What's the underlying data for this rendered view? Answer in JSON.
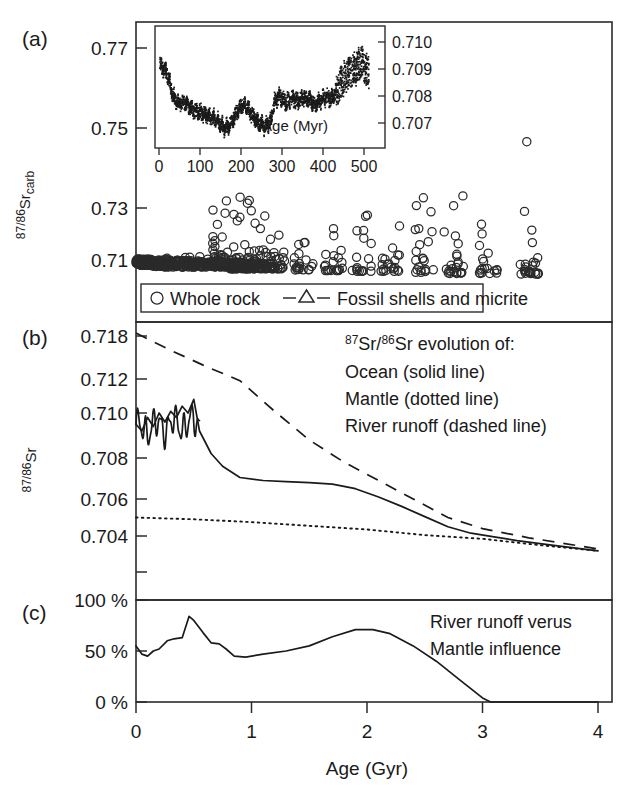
{
  "figure": {
    "panels": [
      {
        "letter": "(a)"
      },
      {
        "letter": "(b)"
      },
      {
        "letter": "(c)"
      }
    ],
    "xaxis": {
      "title": "Age (Gyr)",
      "ticks": [
        "0",
        "1",
        "2",
        "3",
        "4"
      ],
      "range": [
        0,
        4
      ]
    }
  },
  "panel_a": {
    "letter": "(a)",
    "ylabel_main": "87/86",
    "ylabel_element": "Sr",
    "ylabel_sub": "carb",
    "yticks": [
      "0.77",
      "0.75",
      "0.73",
      "0.71"
    ],
    "legend": [
      {
        "symbol": "circle",
        "label": "Whole rock"
      },
      {
        "symbol": "triangle-line",
        "label": "Fossil shells and micrite"
      }
    ],
    "inset": {
      "xlabel": "Age (Myr)",
      "xticks": [
        "0",
        "100",
        "200",
        "300",
        "400",
        "500"
      ],
      "yticks": [
        "0.710",
        "0.709",
        "0.708",
        "0.707"
      ],
      "xrange": [
        0,
        550
      ],
      "yrange": [
        0.7065,
        0.7105
      ]
    }
  },
  "panel_b": {
    "letter": "(b)",
    "ylabel_main": "87/86",
    "ylabel_element": "Sr",
    "yticks": [
      "0.718",
      "0.712",
      "0.710",
      "0.708",
      "0.706",
      "0.704"
    ],
    "annotation": [
      "87Sr/86Sr evolution of:",
      "Ocean (solid line)",
      "Mantle (dotted line)",
      "River runoff (dashed line)"
    ],
    "annotation_line1_parts": {
      "sup1": "87",
      "mid": "Sr/",
      "sup2": "86",
      "tail": "Sr evolution of:"
    }
  },
  "panel_c": {
    "letter": "(c)",
    "yticks": [
      "100 %",
      "50 %",
      "0 %"
    ],
    "annotation": [
      "River runoff verus",
      "Mantle influence"
    ]
  },
  "chart_data": {
    "type": "line",
    "xlabel": "Age (Gyr)",
    "xlim": [
      0,
      4
    ],
    "panels": [
      {
        "id": "a",
        "type": "scatter",
        "ylabel": "87/86Sr_carb",
        "ylim": [
          0.7,
          0.781
        ],
        "yticks": [
          0.77,
          0.75,
          0.73,
          0.71
        ],
        "legend": [
          "Whole rock",
          "Fossil shells and micrite"
        ],
        "description": "Measured 87/86Sr of carbonates (whole rock, fossil shells and micrite) versus age; scatter increases with age due to diagenetic alteration.",
        "clusters": [
          {
            "age": 0.02,
            "n": 26,
            "sr_min": 0.7085,
            "sr_max": 0.7105
          },
          {
            "age": 0.1,
            "n": 22,
            "sr_min": 0.7085,
            "sr_max": 0.7105
          },
          {
            "age": 0.2,
            "n": 20,
            "sr_min": 0.7082,
            "sr_max": 0.7105
          },
          {
            "age": 0.3,
            "n": 18,
            "sr_min": 0.708,
            "sr_max": 0.7108
          },
          {
            "age": 0.45,
            "n": 24,
            "sr_min": 0.708,
            "sr_max": 0.711
          },
          {
            "age": 0.6,
            "n": 26,
            "sr_min": 0.708,
            "sr_max": 0.716
          },
          {
            "age": 0.75,
            "n": 40,
            "sr_min": 0.708,
            "sr_max": 0.727
          },
          {
            "age": 0.9,
            "n": 46,
            "sr_min": 0.7075,
            "sr_max": 0.731
          },
          {
            "age": 1.05,
            "n": 40,
            "sr_min": 0.7075,
            "sr_max": 0.73
          },
          {
            "age": 1.2,
            "n": 30,
            "sr_min": 0.7075,
            "sr_max": 0.722
          },
          {
            "age": 1.45,
            "n": 20,
            "sr_min": 0.7072,
            "sr_max": 0.716
          },
          {
            "age": 1.7,
            "n": 22,
            "sr_min": 0.707,
            "sr_max": 0.719
          },
          {
            "age": 1.95,
            "n": 18,
            "sr_min": 0.7068,
            "sr_max": 0.724
          },
          {
            "age": 2.2,
            "n": 20,
            "sr_min": 0.7068,
            "sr_max": 0.723
          },
          {
            "age": 2.5,
            "n": 22,
            "sr_min": 0.7065,
            "sr_max": 0.729
          },
          {
            "age": 2.75,
            "n": 24,
            "sr_min": 0.7062,
            "sr_max": 0.73
          },
          {
            "age": 3.05,
            "n": 18,
            "sr_min": 0.7062,
            "sr_max": 0.725
          },
          {
            "age": 3.4,
            "n": 26,
            "sr_min": 0.706,
            "sr_max": 0.756
          }
        ],
        "inset": {
          "type": "scatter",
          "xlabel": "Age (Myr)",
          "xlim": [
            0,
            550
          ],
          "xticks": [
            0,
            100,
            200,
            300,
            400,
            500
          ],
          "ylim": [
            0.7065,
            0.7105
          ],
          "yticks": [
            0.707,
            0.708,
            0.709,
            0.71
          ],
          "description": "Phanerozoic seawater 87Sr/86Sr curve: high at 0 Myr (~0.7092), minimum near 170 Myr (~0.7068), oscillating rise toward 500-540 Myr (~0.7092-0.7100).",
          "curve_points": [
            {
              "x": 0,
              "y": 0.70918
            },
            {
              "x": 10,
              "y": 0.70905
            },
            {
              "x": 20,
              "y": 0.7088
            },
            {
              "x": 35,
              "y": 0.708
            },
            {
              "x": 50,
              "y": 0.70775
            },
            {
              "x": 65,
              "y": 0.70778
            },
            {
              "x": 80,
              "y": 0.7076
            },
            {
              "x": 95,
              "y": 0.70745
            },
            {
              "x": 110,
              "y": 0.7074
            },
            {
              "x": 125,
              "y": 0.70732
            },
            {
              "x": 140,
              "y": 0.70722
            },
            {
              "x": 155,
              "y": 0.70705
            },
            {
              "x": 170,
              "y": 0.70682
            },
            {
              "x": 185,
              "y": 0.70702
            },
            {
              "x": 200,
              "y": 0.7074
            },
            {
              "x": 215,
              "y": 0.70775
            },
            {
              "x": 230,
              "y": 0.70755
            },
            {
              "x": 245,
              "y": 0.70725
            },
            {
              "x": 260,
              "y": 0.707
            },
            {
              "x": 275,
              "y": 0.7069
            },
            {
              "x": 290,
              "y": 0.70712
            },
            {
              "x": 300,
              "y": 0.7079
            },
            {
              "x": 315,
              "y": 0.708
            },
            {
              "x": 330,
              "y": 0.7078
            },
            {
              "x": 345,
              "y": 0.70795
            },
            {
              "x": 360,
              "y": 0.70782
            },
            {
              "x": 375,
              "y": 0.708
            },
            {
              "x": 390,
              "y": 0.7079
            },
            {
              "x": 405,
              "y": 0.7077
            },
            {
              "x": 420,
              "y": 0.7079
            },
            {
              "x": 435,
              "y": 0.708
            },
            {
              "x": 450,
              "y": 0.70795
            },
            {
              "x": 465,
              "y": 0.7083
            },
            {
              "x": 480,
              "y": 0.7087
            },
            {
              "x": 495,
              "y": 0.7089
            },
            {
              "x": 510,
              "y": 0.709
            },
            {
              "x": 525,
              "y": 0.7093
            },
            {
              "x": 540,
              "y": 0.70895
            }
          ]
        }
      },
      {
        "id": "b",
        "type": "line",
        "ylabel": "87/86Sr",
        "ylim_labels": [
          0.704,
          0.718
        ],
        "yticks": [
          0.718,
          0.712,
          0.71,
          0.708,
          0.706,
          0.704
        ],
        "ytick_note": "non-linear tick spacing; 0.718 and 0.712 compressed above 0.710",
        "series": [
          {
            "name": "Ocean (solid line)",
            "style": "solid",
            "points": [
              {
                "age": 0.0,
                "sr": 0.7095
              },
              {
                "age": 0.05,
                "sr": 0.7092
              },
              {
                "age": 0.1,
                "sr": 0.7098
              },
              {
                "age": 0.15,
                "sr": 0.7094
              },
              {
                "age": 0.2,
                "sr": 0.71
              },
              {
                "age": 0.25,
                "sr": 0.7096
              },
              {
                "age": 0.3,
                "sr": 0.7101
              },
              {
                "age": 0.35,
                "sr": 0.7098
              },
              {
                "age": 0.4,
                "sr": 0.7104
              },
              {
                "age": 0.45,
                "sr": 0.71
              },
              {
                "age": 0.5,
                "sr": 0.7108
              },
              {
                "age": 0.55,
                "sr": 0.7092
              },
              {
                "age": 0.65,
                "sr": 0.7082
              },
              {
                "age": 0.75,
                "sr": 0.7076
              },
              {
                "age": 0.9,
                "sr": 0.70705
              },
              {
                "age": 1.1,
                "sr": 0.7069
              },
              {
                "age": 1.3,
                "sr": 0.70685
              },
              {
                "age": 1.5,
                "sr": 0.7068
              },
              {
                "age": 1.7,
                "sr": 0.70672
              },
              {
                "age": 1.9,
                "sr": 0.7065
              },
              {
                "age": 2.1,
                "sr": 0.7061
              },
              {
                "age": 2.3,
                "sr": 0.7056
              },
              {
                "age": 2.5,
                "sr": 0.70505
              },
              {
                "age": 2.7,
                "sr": 0.7045
              },
              {
                "age": 2.9,
                "sr": 0.70415
              },
              {
                "age": 3.1,
                "sr": 0.70395
              },
              {
                "age": 3.3,
                "sr": 0.70375
              },
              {
                "age": 3.6,
                "sr": 0.7035
              },
              {
                "age": 4.0,
                "sr": 0.7032
              }
            ]
          },
          {
            "name": "Mantle (dotted line)",
            "style": "dotted",
            "points": [
              {
                "age": 0.0,
                "sr": 0.705
              },
              {
                "age": 0.5,
                "sr": 0.7049
              },
              {
                "age": 1.0,
                "sr": 0.70475
              },
              {
                "age": 1.5,
                "sr": 0.70455
              },
              {
                "age": 2.0,
                "sr": 0.70435
              },
              {
                "age": 2.5,
                "sr": 0.70405
              },
              {
                "age": 3.0,
                "sr": 0.70385
              },
              {
                "age": 3.5,
                "sr": 0.7035
              },
              {
                "age": 4.0,
                "sr": 0.7032
              }
            ]
          },
          {
            "name": "River runoff (dashed line)",
            "style": "dashed",
            "points": [
              {
                "age": 0.0,
                "sr": 0.7184
              },
              {
                "age": 0.3,
                "sr": 0.716
              },
              {
                "age": 0.6,
                "sr": 0.7138
              },
              {
                "age": 0.9,
                "sr": 0.7119
              },
              {
                "age": 1.2,
                "sr": 0.7101
              },
              {
                "age": 1.5,
                "sr": 0.7088
              },
              {
                "age": 1.8,
                "sr": 0.7078
              },
              {
                "age": 2.1,
                "sr": 0.7069
              },
              {
                "age": 2.4,
                "sr": 0.706
              },
              {
                "age": 2.7,
                "sr": 0.705
              },
              {
                "age": 3.0,
                "sr": 0.7044
              },
              {
                "age": 3.4,
                "sr": 0.7039
              },
              {
                "age": 4.0,
                "sr": 0.7033
              }
            ]
          }
        ]
      },
      {
        "id": "c",
        "type": "line",
        "ylabel": "percent",
        "ylim": [
          0,
          100
        ],
        "yticks": [
          0,
          50,
          100
        ],
        "ytick_labels": [
          "0 %",
          "50 %",
          "100 %"
        ],
        "annotation": "River runoff verus Mantle influence",
        "series": [
          {
            "name": "River runoff versus mantle influence",
            "style": "solid",
            "points": [
              {
                "age": 0.0,
                "pct": 55
              },
              {
                "age": 0.05,
                "pct": 47
              },
              {
                "age": 0.1,
                "pct": 45
              },
              {
                "age": 0.15,
                "pct": 50
              },
              {
                "age": 0.2,
                "pct": 52
              },
              {
                "age": 0.27,
                "pct": 60
              },
              {
                "age": 0.33,
                "pct": 62
              },
              {
                "age": 0.4,
                "pct": 63
              },
              {
                "age": 0.46,
                "pct": 84
              },
              {
                "age": 0.5,
                "pct": 80
              },
              {
                "age": 0.58,
                "pct": 68
              },
              {
                "age": 0.65,
                "pct": 58
              },
              {
                "age": 0.72,
                "pct": 57
              },
              {
                "age": 0.78,
                "pct": 52
              },
              {
                "age": 0.85,
                "pct": 45
              },
              {
                "age": 0.95,
                "pct": 44
              },
              {
                "age": 1.1,
                "pct": 47
              },
              {
                "age": 1.3,
                "pct": 50
              },
              {
                "age": 1.5,
                "pct": 55
              },
              {
                "age": 1.7,
                "pct": 64
              },
              {
                "age": 1.9,
                "pct": 71
              },
              {
                "age": 2.05,
                "pct": 71
              },
              {
                "age": 2.2,
                "pct": 67
              },
              {
                "age": 2.4,
                "pct": 55
              },
              {
                "age": 2.6,
                "pct": 40
              },
              {
                "age": 2.8,
                "pct": 22
              },
              {
                "age": 3.0,
                "pct": 4
              },
              {
                "age": 3.07,
                "pct": 0
              },
              {
                "age": 4.0,
                "pct": 0
              }
            ]
          }
        ]
      }
    ]
  }
}
